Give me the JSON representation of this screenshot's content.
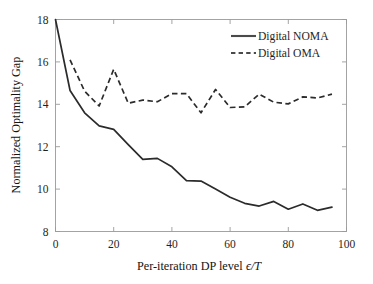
{
  "chart_data": {
    "type": "line",
    "title": "",
    "xlabel": "Per-iteration DP level",
    "xlabel_math": "ϵ/T",
    "ylabel": "Normalized Optimality Gap",
    "xlim": [
      0,
      100
    ],
    "ylim": [
      8,
      18
    ],
    "xticks": [
      0,
      20,
      40,
      60,
      80,
      100
    ],
    "yticks": [
      8,
      10,
      12,
      14,
      16,
      18
    ],
    "xticklabels": [
      "0",
      "20",
      "40",
      "60",
      "80",
      "100"
    ],
    "yticklabels": [
      "8",
      "10",
      "12",
      "14",
      "16",
      "18"
    ],
    "grid": false,
    "legend_position": "upper right",
    "legend_frame": false,
    "line_color": "#2b2b2b",
    "axis_color": "#9a9a9a",
    "background": "#ffffff",
    "series": [
      {
        "name": "Digital NOMA",
        "style": "solid",
        "x": [
          0,
          5,
          10,
          15,
          20,
          25,
          30,
          35,
          40,
          45,
          50,
          55,
          60,
          65,
          70,
          75,
          80,
          85,
          90,
          95
        ],
        "y": [
          18.0,
          14.65,
          13.6,
          12.98,
          12.82,
          12.1,
          11.4,
          11.45,
          11.05,
          10.4,
          10.38,
          10.0,
          9.62,
          9.33,
          9.2,
          9.42,
          9.05,
          9.3,
          9.0,
          9.15
        ]
      },
      {
        "name": "Digital OMA",
        "style": "dashed",
        "x": [
          5,
          10,
          15,
          20,
          25,
          30,
          35,
          40,
          45,
          50,
          55,
          60,
          65,
          70,
          75,
          80,
          85,
          90,
          95
        ],
        "y": [
          16.1,
          14.62,
          13.92,
          15.65,
          14.05,
          14.2,
          14.12,
          14.5,
          14.5,
          13.6,
          14.7,
          13.85,
          13.88,
          14.48,
          14.1,
          14.02,
          14.35,
          14.3,
          14.48
        ]
      }
    ]
  },
  "legend": {
    "entries": [
      {
        "label": "Digital NOMA",
        "style": "solid"
      },
      {
        "label": "Digital OMA",
        "style": "dashed"
      }
    ]
  }
}
